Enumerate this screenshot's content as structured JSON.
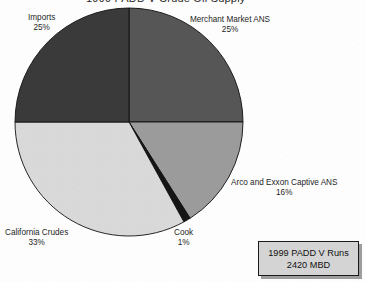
{
  "title": "1999 PADD V Crude Oil Supply",
  "annotation": {
    "line1": "1999 PADD V Runs",
    "line2": "2420 MBD"
  },
  "labels": {
    "merchant": {
      "name": "Merchant Market ANS",
      "pct": "25%"
    },
    "imports": {
      "name": "Imports",
      "pct": "25%"
    },
    "arco": {
      "name": "Arco and Exxon Captive ANS",
      "pct": "16%"
    },
    "california": {
      "name": "California Crudes",
      "pct": "33%"
    },
    "cook": {
      "name": "Cook",
      "pct": "1%"
    }
  },
  "chart_data": {
    "type": "pie",
    "title": "1999 PADD V Crude Oil Supply",
    "start_angle_deg": 0,
    "direction": "clockwise",
    "center": [
      129,
      122
    ],
    "radius": 114,
    "legend": "none",
    "grid": false,
    "units": "percent of 2420 MBD",
    "categories": [
      "Merchant Market ANS",
      "Arco and Exxon Captive ANS",
      "Cook",
      "California Crudes",
      "Imports"
    ],
    "values": [
      25,
      16,
      1,
      33,
      25
    ],
    "labels": [
      "25%",
      "16%",
      "1%",
      "33%",
      "25%"
    ],
    "colors": [
      "#565656",
      "#9b9b9b",
      "#151515",
      "#d9d9d9",
      "#3a3a3a"
    ],
    "edge_color": "#111111",
    "annotations": [
      "1999 PADD V Runs",
      "2420 MBD"
    ]
  }
}
